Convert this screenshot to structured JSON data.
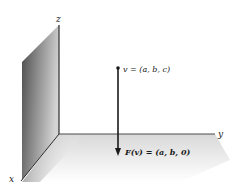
{
  "figure": {
    "type": "3d-projection-diagram",
    "axes": {
      "x": {
        "label": "x"
      },
      "y": {
        "label": "y"
      },
      "z": {
        "label": "z"
      }
    },
    "vector": {
      "label": "v = (a, b, c)"
    },
    "projection": {
      "label": "F(v) = (a, b, 0)"
    },
    "colors": {
      "ink": "#222222",
      "wall_dark": "#5a5a5a",
      "wall_light": "#cfcfcf",
      "floor": "#e6e6e6",
      "background": "#ffffff"
    }
  }
}
